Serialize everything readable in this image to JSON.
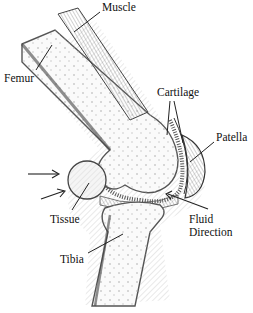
{
  "diagram": {
    "labels": {
      "muscle": "Muscle",
      "femur": "Femur",
      "cartilage": "Cartilage",
      "patella": "Patella",
      "tissue": "Tissue",
      "fluid_direction_line1": "Fluid",
      "fluid_direction_line2": "Direction",
      "tibia": "Tibia"
    },
    "arrows": [
      {
        "name": "inflow-arrow-upper",
        "direction": "right"
      },
      {
        "name": "inflow-arrow-lower",
        "direction": "up-right"
      },
      {
        "name": "fluid-direction-arrow",
        "direction": "up-left"
      }
    ],
    "colors": {
      "ink": "#222222",
      "hatch": "#888888",
      "background": "#ffffff"
    }
  }
}
